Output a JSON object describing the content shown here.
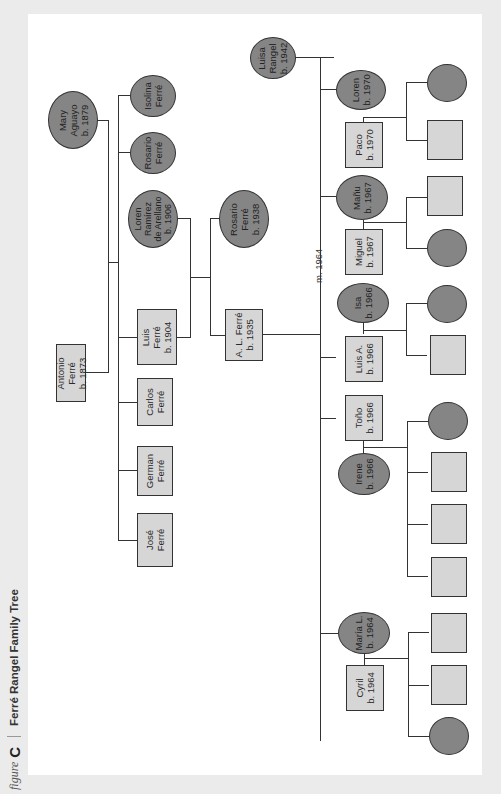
{
  "header": {
    "figure_word": "figure",
    "figure_letter": "C",
    "title": "Ferré Rangel Family Tree"
  },
  "colors": {
    "background": "#ebebeb",
    "panel": "#ffffff",
    "male_fill": "#d6d6d6",
    "female_fill": "#858585",
    "line": "#333333"
  },
  "legend_shapes": {
    "male": "rectangle",
    "female": "ellipse"
  },
  "generation1": {
    "father": {
      "name": "Antonio\nFerré\nb. 1873",
      "sex": "male"
    },
    "mother": {
      "name": "Mary\nAguayo\nb. 1879",
      "sex": "female"
    }
  },
  "generation2": [
    {
      "name": "Isolina\nFerré",
      "sex": "female"
    },
    {
      "name": "Rosario\nFerré",
      "sex": "female"
    },
    {
      "name": "Luis\nFerré\nb. 1904",
      "sex": "male",
      "spouse": "Loren\nRamírez\nde Arellano\nb. 1906"
    },
    {
      "name": "Carlos\nFerré",
      "sex": "male"
    },
    {
      "name": "German\nFerré",
      "sex": "male"
    },
    {
      "name": "José\nFerré",
      "sex": "male"
    }
  ],
  "generation3": [
    {
      "name": "Rosario\nFerré\nb. 1938",
      "sex": "female"
    },
    {
      "name": "A. L. Ferré\nb. 1935",
      "sex": "male",
      "spouse": "Luisa\nRangel\nb. 1942",
      "marriage": "m. 1964"
    }
  ],
  "generation4": [
    {
      "name": "Loren\nb. 1970",
      "sex": "female",
      "spouse": "Paco\nb. 1970",
      "children": [
        "female",
        "male"
      ]
    },
    {
      "name": "Mañu\nb. 1967",
      "sex": "female",
      "spouse": "Miguel\nb. 1967",
      "children": [
        "male",
        "female"
      ]
    },
    {
      "name": "Luis A.\nb. 1966",
      "sex": "male",
      "spouse": "Isa\nb. 1966",
      "children": [
        "female",
        "male"
      ]
    },
    {
      "name": "Toño\nb. 1966",
      "sex": "male",
      "spouse": "Irene\nb. 1966",
      "children": [
        "female",
        "male",
        "male",
        "male"
      ]
    },
    {
      "name": "María L.\nb. 1964",
      "sex": "female",
      "spouse": "Cyril\nb. 1964",
      "children": [
        "male",
        "male",
        "female"
      ]
    }
  ]
}
